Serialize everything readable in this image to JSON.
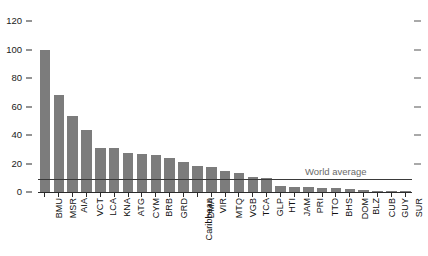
{
  "chart_data": {
    "type": "bar",
    "title": "",
    "subtitle": "",
    "xlabel": "",
    "ylabel": "",
    "ylim": [
      0,
      120
    ],
    "yticks": [
      0,
      20,
      40,
      60,
      80,
      100,
      120
    ],
    "ytick_labels": [
      "0",
      "20",
      "40",
      "60",
      "80",
      "100",
      "120"
    ],
    "grid": false,
    "legend": "none",
    "bar_color": "#7c7c7c",
    "categories": [
      "BMU",
      "MSR",
      "AIA",
      "VCT",
      "LCA",
      "KNA",
      "ATG",
      "CYM",
      "BRB",
      "GRD",
      "Caribbean",
      "DMA",
      "VIR",
      "MTQ",
      "VGB",
      "TCA",
      "GLP",
      "HTI",
      "JAM",
      "PRI",
      "TTO",
      "BHS",
      "DOM",
      "BLZ",
      "CUB",
      "GUY",
      "SUR"
    ],
    "values": [
      100,
      68,
      53,
      43.5,
      31,
      31,
      27.5,
      27,
      26,
      24,
      21,
      18,
      17.5,
      15,
      13.5,
      10.5,
      10,
      4,
      3.8,
      3.5,
      3,
      2.5,
      2,
      1.2,
      0.8,
      0.6,
      0.5
    ],
    "annotations": [
      {
        "name": "world-average",
        "label": "World average",
        "value": 9,
        "line_color": "#3a3a3a",
        "label_color": "#6a6a6a"
      }
    ],
    "right_axis_ticks": [
      20,
      40,
      60,
      80,
      100,
      120
    ]
  }
}
